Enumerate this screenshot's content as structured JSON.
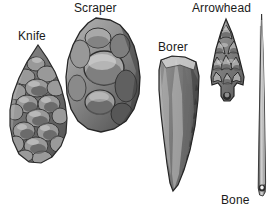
{
  "figure": {
    "background_color": "#ffffff",
    "label_color": "#1a1a1a",
    "width": 275,
    "height": 211
  },
  "labels": {
    "knife": "Knife",
    "scraper": "Scraper",
    "borer": "Borer",
    "arrowhead": "Arrowhead",
    "bone_needle_line1": "Bone",
    "bone_needle_line2": "needle"
  },
  "artifacts": [
    {
      "id": "knife",
      "label": "Knife",
      "material": "flint",
      "shape": "leaf-shaped biface with pointed tip, flake scars",
      "icon": "knife-artifact-icon"
    },
    {
      "id": "scraper",
      "label": "Scraper",
      "material": "flint",
      "shape": "broad rounded oval core with large concave flake scars",
      "icon": "scraper-artifact-icon"
    },
    {
      "id": "borer",
      "label": "Borer",
      "material": "flint",
      "shape": "elongated blade tapering to a drill point",
      "icon": "borer-artifact-icon"
    },
    {
      "id": "arrowhead",
      "label": "Arrowhead",
      "material": "flint",
      "shape": "triangular point with notched barbed base and stem",
      "icon": "arrowhead-artifact-icon"
    },
    {
      "id": "bone_needle",
      "label": "Bone needle",
      "material": "bone",
      "shape": "long slender shaft tapering to a point, eye hole at base",
      "icon": "bone-needle-artifact-icon"
    }
  ]
}
